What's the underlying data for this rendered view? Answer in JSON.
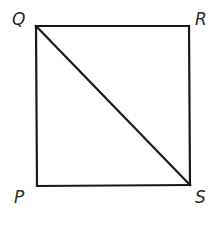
{
  "figure": {
    "type": "square-with-diagonal",
    "stroke_color": "#1a1a1a",
    "label_color": "#2a2a2a",
    "vertices": {
      "Q": {
        "label": "Q",
        "x": 36,
        "y": 26
      },
      "R": {
        "label": "R",
        "x": 189,
        "y": 26
      },
      "S": {
        "label": "S",
        "x": 190,
        "y": 185
      },
      "P": {
        "label": "P",
        "x": 37,
        "y": 186
      }
    },
    "segments": [
      {
        "from": "Q",
        "to": "R"
      },
      {
        "from": "R",
        "to": "S"
      },
      {
        "from": "S",
        "to": "P"
      },
      {
        "from": "P",
        "to": "Q"
      },
      {
        "from": "Q",
        "to": "S"
      }
    ]
  }
}
